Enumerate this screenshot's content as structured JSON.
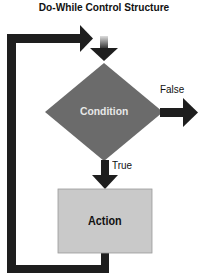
{
  "title": "Do-While Control Structure",
  "nodes": {
    "condition": {
      "label": "Condition",
      "shape": "diamond",
      "fill": "#6b6b6b",
      "text_color": "#e8e8e8"
    },
    "action": {
      "label": "Action",
      "shape": "rectangle",
      "fill": "#c9c9c9",
      "text_color": "#111111"
    }
  },
  "edges": {
    "false_label": "False",
    "true_label": "True"
  },
  "colors": {
    "arrow": "#1e1e1e",
    "background": "#ffffff"
  }
}
